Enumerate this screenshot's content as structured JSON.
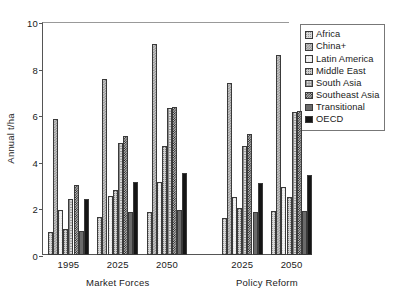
{
  "chart_data": {
    "type": "bar",
    "title": "",
    "xlabel": "",
    "ylabel": "Annual t/ha",
    "ylim": [
      0,
      10
    ],
    "yticks": [
      0,
      2,
      4,
      6,
      8,
      10
    ],
    "grid": false,
    "legend_position": "right",
    "groups": [
      {
        "scenario": "Market Forces",
        "year": "1995"
      },
      {
        "scenario": "Market Forces",
        "year": "2025"
      },
      {
        "scenario": "Market Forces",
        "year": "2050"
      },
      {
        "scenario": "Policy Reform",
        "year": "2025"
      },
      {
        "scenario": "Policy Reform",
        "year": "2050"
      }
    ],
    "categories": [
      "1995",
      "2025",
      "2050",
      "2025",
      "2050"
    ],
    "scenarios": [
      "Market Forces",
      "Policy Reform"
    ],
    "series": [
      {
        "name": "Africa",
        "values": [
          1.0,
          1.65,
          1.85,
          1.6,
          1.9
        ]
      },
      {
        "name": "China+",
        "values": [
          5.85,
          7.55,
          9.05,
          7.4,
          8.6
        ]
      },
      {
        "name": "Latin America",
        "values": [
          1.95,
          2.55,
          3.15,
          2.5,
          2.9
        ]
      },
      {
        "name": "Middle East",
        "values": [
          1.1,
          2.8,
          4.7,
          2.0,
          2.5
        ]
      },
      {
        "name": "South Asia",
        "values": [
          2.4,
          4.8,
          6.3,
          4.7,
          6.15
        ]
      },
      {
        "name": "Southeast Asia",
        "values": [
          3.0,
          5.1,
          6.35,
          5.2,
          6.2
        ]
      },
      {
        "name": "Transitional",
        "values": [
          1.05,
          1.85,
          1.95,
          1.85,
          1.9
        ]
      },
      {
        "name": "OECD",
        "values": [
          2.4,
          3.15,
          3.5,
          3.1,
          3.45
        ]
      }
    ]
  },
  "legend": {
    "items": [
      {
        "label": "Africa",
        "swatch": "swatch-africa"
      },
      {
        "label": "China+",
        "swatch": "swatch-china-plus"
      },
      {
        "label": "Latin America",
        "swatch": "swatch-latin-america"
      },
      {
        "label": "Middle East",
        "swatch": "swatch-middle-east"
      },
      {
        "label": "South Asia",
        "swatch": "swatch-south-asia"
      },
      {
        "label": "Southeast Asia",
        "swatch": "swatch-southeast-asia"
      },
      {
        "label": "Transitional",
        "swatch": "swatch-transitional"
      },
      {
        "label": "OECD",
        "swatch": "swatch-oecd"
      }
    ]
  }
}
